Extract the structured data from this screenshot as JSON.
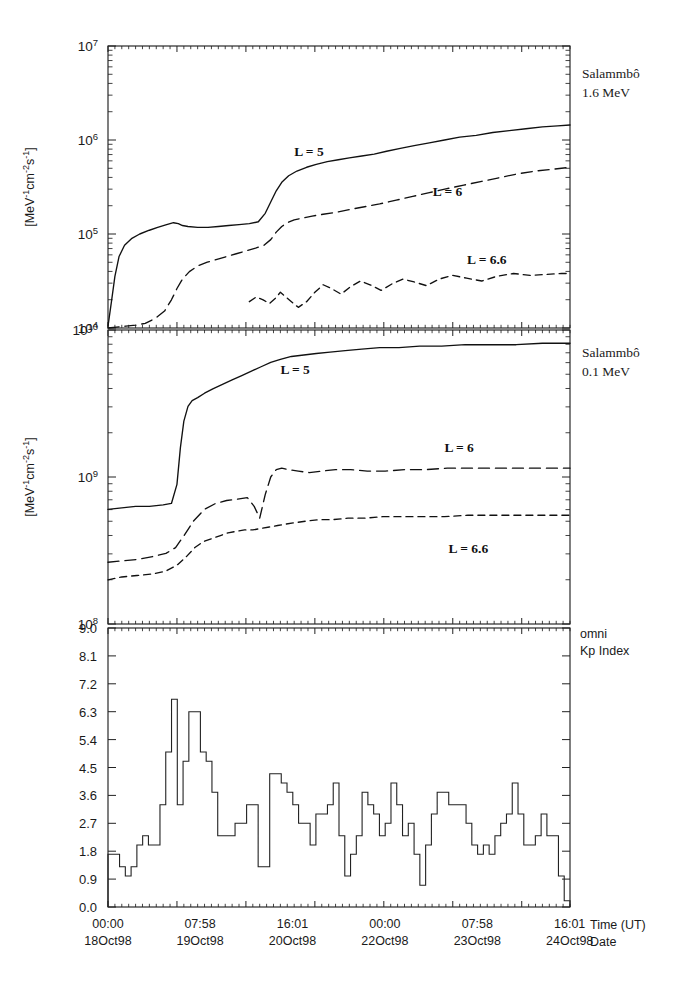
{
  "figure": {
    "title_none": "",
    "width": 681,
    "height": 995,
    "ink_color": "#111111"
  },
  "panels": [
    {
      "id": "panel-flux-1p6mev",
      "note_line1": "Salammbô",
      "note_line2": "1.6 MeV",
      "ylabel": "[MeV",
      "ylabel_full": "[MeV-1cm-2s-1]",
      "yticks": [
        "10⁷",
        "10⁶",
        "10⁵",
        "10⁴"
      ],
      "ylim_log": [
        4,
        7
      ],
      "curve_labels": [
        {
          "text": "L = 5",
          "x_frac": 0.435,
          "y_log": 5.83
        },
        {
          "text": "L = 6",
          "x_frac": 0.735,
          "y_log": 5.4
        },
        {
          "text": "L = 6.6",
          "x_frac": 0.82,
          "y_log": 4.68
        }
      ]
    },
    {
      "id": "panel-flux-0p1mev",
      "note_line1": "Salammbô",
      "note_line2": "0.1 MeV",
      "ylabel": "[MeV",
      "ylabel_full": "[MeV-1cm-2s-1]",
      "yticks": [
        "10¹⁰",
        "10⁹",
        "10⁸"
      ],
      "ylim_log": [
        8,
        10
      ],
      "curve_labels": [
        {
          "text": "L = 5",
          "x_frac": 0.405,
          "y_log": 9.7
        },
        {
          "text": "L = 6",
          "x_frac": 0.76,
          "y_log": 9.17
        },
        {
          "text": "L = 6.6",
          "x_frac": 0.78,
          "y_log": 8.48
        }
      ]
    },
    {
      "id": "panel-kp-index",
      "note_line1": "omni",
      "note_line2": "Kp Index",
      "ylabel": "",
      "yticks": [
        "9.0",
        "8.1",
        "7.2",
        "6.3",
        "5.4",
        "4.5",
        "3.6",
        "2.7",
        "1.8",
        "0.9",
        "0.0"
      ],
      "ylim": [
        0.0,
        9.0
      ]
    }
  ],
  "xaxis": {
    "name_line1": "Time (UT)",
    "name_line2": "Date",
    "ticks": [
      {
        "time": "00:00",
        "date": "18Oct98",
        "x_frac": 0.0
      },
      {
        "time": "07:58",
        "date": "19Oct98",
        "x_frac": 0.1993
      },
      {
        "time": "16:01",
        "date": "20Oct98",
        "x_frac": 0.3993
      },
      {
        "time": "00:00",
        "date": "22Oct98",
        "x_frac": 0.5993
      },
      {
        "time": "07:58",
        "date": "23Oct98",
        "x_frac": 0.7993
      },
      {
        "time": "16:01",
        "date": "24Oct98",
        "x_frac": 0.9993
      }
    ],
    "minor_per_major": 10
  },
  "chart_data": {
    "type": "line",
    "xlabel": "Time (UT) / Date",
    "x_unit": "days from 18Oct98 00:00 UT",
    "x_range_days": [
      0,
      6.7
    ],
    "subplots": [
      {
        "name": "Salammbo 1.6 MeV",
        "ylabel": "[MeV-1cm-2s-1]",
        "yscale": "log",
        "ylim": [
          10000,
          10000000
        ],
        "ytick_values": [
          10000,
          100000,
          1000000,
          10000000
        ],
        "series": [
          {
            "name": "L = 5",
            "style": "solid",
            "x": [
              0.0,
              0.05,
              0.1,
              0.16,
              0.24,
              0.34,
              0.46,
              0.6,
              0.72,
              0.85,
              0.95,
              1.02,
              1.08,
              1.16,
              1.3,
              1.45,
              1.6,
              1.75,
              1.9,
              2.05,
              2.18,
              2.28,
              2.36,
              2.44,
              2.52,
              2.62,
              2.74,
              2.88,
              3.02,
              3.18,
              3.34,
              3.5,
              3.68,
              3.86,
              4.04,
              4.24,
              4.44,
              4.66,
              4.88,
              5.1,
              5.34,
              5.58,
              5.82,
              6.06,
              6.3,
              6.52,
              6.7
            ],
            "y_log10": [
              4.02,
              4.28,
              4.55,
              4.76,
              4.88,
              4.95,
              5.0,
              5.04,
              5.07,
              5.1,
              5.12,
              5.11,
              5.09,
              5.08,
              5.07,
              5.07,
              5.08,
              5.09,
              5.1,
              5.11,
              5.13,
              5.22,
              5.34,
              5.46,
              5.55,
              5.62,
              5.67,
              5.71,
              5.74,
              5.77,
              5.79,
              5.81,
              5.83,
              5.85,
              5.88,
              5.91,
              5.94,
              5.97,
              6.0,
              6.03,
              6.05,
              6.08,
              6.1,
              6.12,
              6.14,
              6.15,
              6.16
            ]
          },
          {
            "name": "L = 6",
            "style": "dashed",
            "x": [
              0.0,
              0.12,
              0.26,
              0.4,
              0.54,
              0.68,
              0.82,
              0.92,
              1.0,
              1.08,
              1.18,
              1.3,
              1.44,
              1.58,
              1.72,
              1.86,
              2.0,
              2.14,
              2.26,
              2.36,
              2.44,
              2.52,
              2.6,
              2.7,
              2.82,
              2.96,
              3.12,
              3.3,
              3.5,
              3.72,
              3.94,
              4.18,
              4.42,
              4.66,
              4.9,
              5.16,
              5.42,
              5.68,
              5.94,
              6.2,
              6.46,
              6.7
            ],
            "y_log10": [
              4.0,
              4.01,
              4.02,
              4.03,
              4.05,
              4.1,
              4.18,
              4.3,
              4.42,
              4.52,
              4.6,
              4.66,
              4.7,
              4.73,
              4.76,
              4.79,
              4.82,
              4.85,
              4.88,
              4.94,
              5.02,
              5.08,
              5.12,
              5.15,
              5.17,
              5.19,
              5.21,
              5.23,
              5.26,
              5.29,
              5.32,
              5.36,
              5.4,
              5.44,
              5.48,
              5.52,
              5.56,
              5.6,
              5.64,
              5.67,
              5.69,
              5.71
            ]
          },
          {
            "name": "L = 6.6",
            "style": "dotted-dashed",
            "x": [
              2.05,
              2.15,
              2.25,
              2.34,
              2.42,
              2.5,
              2.58,
              2.66,
              2.76,
              2.88,
              3.0,
              3.12,
              3.24,
              3.38,
              3.52,
              3.66,
              3.8,
              3.96,
              4.12,
              4.28,
              4.44,
              4.62,
              4.8,
              5.0,
              5.2,
              5.42,
              5.64,
              5.88,
              6.12,
              6.36,
              6.58,
              6.7
            ],
            "y_log10": [
              4.28,
              4.33,
              4.3,
              4.26,
              4.31,
              4.38,
              4.33,
              4.28,
              4.22,
              4.28,
              4.38,
              4.46,
              4.42,
              4.36,
              4.44,
              4.5,
              4.46,
              4.4,
              4.47,
              4.52,
              4.49,
              4.45,
              4.52,
              4.56,
              4.53,
              4.5,
              4.55,
              4.58,
              4.56,
              4.57,
              4.58,
              4.58
            ]
          }
        ]
      },
      {
        "name": "Salammbo 0.1 MeV",
        "ylabel": "[MeV-1cm-2s-1]",
        "yscale": "log",
        "ylim": [
          100000000,
          10000000000
        ],
        "ytick_values": [
          100000000,
          1000000000,
          10000000000
        ],
        "series": [
          {
            "name": "L = 5",
            "style": "solid",
            "x": [
              0.0,
              0.2,
              0.4,
              0.6,
              0.8,
              0.92,
              1.0,
              1.05,
              1.1,
              1.16,
              1.22,
              1.3,
              1.4,
              1.52,
              1.66,
              1.8,
              1.94,
              2.08,
              2.22,
              2.36,
              2.5,
              2.66,
              2.84,
              3.02,
              3.22,
              3.44,
              3.68,
              3.94,
              4.22,
              4.52,
              4.84,
              5.18,
              5.54,
              5.92,
              6.3,
              6.7
            ],
            "y_log10": [
              8.78,
              8.79,
              8.8,
              8.8,
              8.81,
              8.82,
              8.95,
              9.2,
              9.38,
              9.48,
              9.52,
              9.54,
              9.57,
              9.6,
              9.63,
              9.66,
              9.69,
              9.72,
              9.75,
              9.78,
              9.8,
              9.82,
              9.83,
              9.84,
              9.85,
              9.86,
              9.87,
              9.88,
              9.88,
              9.89,
              9.89,
              9.9,
              9.9,
              9.9,
              9.91,
              9.91
            ]
          },
          {
            "name": "L = 6",
            "style": "dashed",
            "x": [
              0.0,
              0.22,
              0.44,
              0.66,
              0.84,
              0.98,
              1.1,
              1.24,
              1.4,
              1.56,
              1.72,
              1.88,
              2.02,
              2.12,
              2.2,
              2.28,
              2.36,
              2.44,
              2.52,
              2.62,
              2.76,
              2.92,
              3.1,
              3.3,
              3.52,
              3.76,
              4.02,
              4.3,
              4.6,
              4.92,
              5.26,
              5.62,
              6.0,
              6.36,
              6.7
            ],
            "y_log10": [
              8.42,
              8.43,
              8.44,
              8.46,
              8.48,
              8.52,
              8.6,
              8.7,
              8.78,
              8.82,
              8.84,
              8.85,
              8.86,
              8.8,
              8.72,
              8.88,
              9.0,
              9.05,
              9.06,
              9.05,
              9.04,
              9.03,
              9.04,
              9.05,
              9.05,
              9.04,
              9.04,
              9.05,
              9.05,
              9.06,
              9.06,
              9.06,
              9.06,
              9.06,
              9.06
            ]
          },
          {
            "name": "L = 6.6",
            "style": "dotted-dashed",
            "x": [
              0.0,
              0.2,
              0.42,
              0.64,
              0.84,
              1.0,
              1.14,
              1.26,
              1.38,
              1.5,
              1.62,
              1.74,
              1.86,
              1.98,
              2.1,
              2.22,
              2.34,
              2.46,
              2.58,
              2.72,
              2.88,
              3.06,
              3.26,
              3.48,
              3.72,
              3.98,
              4.26,
              4.56,
              4.88,
              5.22,
              5.58,
              5.96,
              6.34,
              6.7
            ],
            "y_log10": [
              8.3,
              8.32,
              8.33,
              8.34,
              8.36,
              8.4,
              8.46,
              8.52,
              8.56,
              8.58,
              8.6,
              8.62,
              8.63,
              8.64,
              8.64,
              8.65,
              8.66,
              8.67,
              8.68,
              8.69,
              8.7,
              8.71,
              8.71,
              8.72,
              8.72,
              8.73,
              8.73,
              8.73,
              8.73,
              8.74,
              8.74,
              8.74,
              8.74,
              8.74
            ]
          }
        ]
      },
      {
        "name": "omni Kp Index",
        "ylabel": "Kp",
        "yscale": "linear",
        "ylim": [
          0.0,
          9.0
        ],
        "ytick_values": [
          0.0,
          0.9,
          1.8,
          2.7,
          3.6,
          4.5,
          5.4,
          6.3,
          7.2,
          8.1,
          9.0
        ],
        "step_hours": 3,
        "series": [
          {
            "name": "Kp",
            "style": "step",
            "values": [
              1.7,
              1.7,
              1.3,
              1.0,
              1.3,
              2.0,
              2.3,
              2.0,
              2.0,
              3.3,
              5.0,
              6.7,
              3.3,
              4.7,
              6.3,
              6.3,
              5.0,
              4.7,
              3.7,
              2.3,
              2.3,
              2.3,
              2.7,
              2.7,
              3.3,
              3.3,
              1.3,
              1.3,
              4.3,
              4.3,
              4.0,
              3.7,
              3.3,
              2.7,
              2.7,
              2.0,
              3.0,
              3.0,
              3.3,
              4.0,
              2.3,
              1.0,
              1.7,
              2.3,
              3.7,
              3.3,
              3.0,
              2.3,
              2.7,
              4.0,
              3.3,
              2.3,
              2.7,
              1.7,
              0.7,
              2.0,
              3.0,
              3.7,
              3.7,
              3.3,
              3.3,
              3.3,
              2.7,
              2.0,
              1.7,
              2.0,
              1.7,
              2.3,
              2.7,
              3.0,
              4.0,
              3.0,
              2.0,
              2.0,
              2.3,
              3.0,
              2.3,
              2.3,
              1.0,
              0.2
            ]
          }
        ]
      }
    ]
  }
}
